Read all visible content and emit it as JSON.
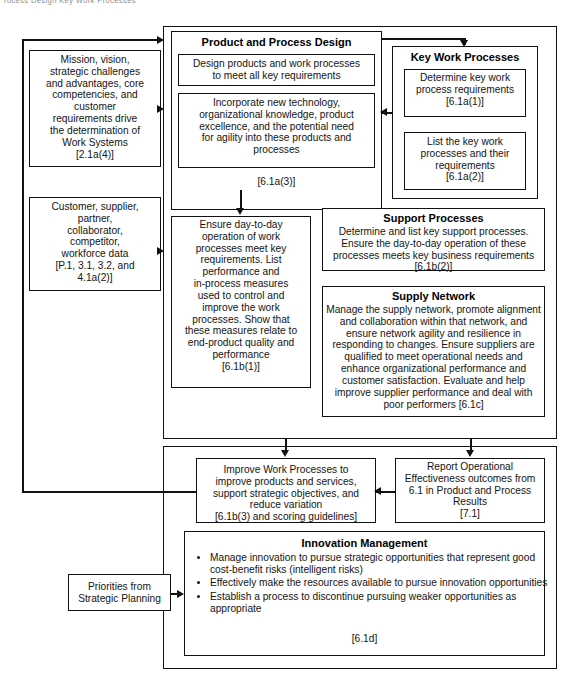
{
  "page": {
    "top_fragment": "rocess Design  Key Work Processes"
  },
  "left_column": {
    "box1": {
      "text": "Mission, vision,\nstrategic challenges\nand advantages, core\ncompetencies, and\ncustomer\nrequirements drive\nthe determination of\nWork Systems\n[2.1a(4)]"
    },
    "box2": {
      "text": "Customer, supplier,\npartner,\ncollaborator,\ncompetitor,\nworkforce data\n[P.1, 3.1, 3.2, and\n4.1a(2)]"
    },
    "box3": {
      "text": "Priorities from\nStrategic Planning"
    }
  },
  "product_process_design": {
    "title": "Product and Process Design",
    "sub1": "Design products and work processes\nto meet all key requirements",
    "sub2": "Incorporate new technology,\norganizational knowledge, product\nexcellence, and the potential need\nfor agility into these products and\nprocesses",
    "code": "[6.1a(3)]"
  },
  "key_work_processes": {
    "title": "Key Work Processes",
    "sub1": "Determine key work\nprocess requirements\n[6.1a(1)]",
    "sub2": "List the key work\nprocesses and their\nrequirements\n[6.1a(2)]"
  },
  "work_process_management": {
    "text": "Ensure day-to-day\noperation of work\nprocesses meet key\nrequirements. List\nperformance and\nin-process measures\nused to control and\nimprove the work\nprocesses. Show that\nthese measures relate to\nend-product quality and\nperformance\n[6.1b(1)]"
  },
  "support_processes": {
    "title": "Support Processes",
    "text": "Determine and list key support processes.\nEnsure the day-to-day operation of these\nprocesses meets key business requirements\n[6.1b(2)]"
  },
  "supply_network": {
    "title": "Supply Network",
    "text": "Manage the supply network, promote alignment\nand collaboration within that network, and\nensure  network agility and resilience in\nresponding to changes. Ensure suppliers are\nqualified to meet operational needs and\nenhance organizational performance and\ncustomer satisfaction. Evaluate and help\nimprove supplier performance and deal with\npoor performers  [6.1c]"
  },
  "improve_work_processes": {
    "text": "Improve Work Processes to\nimprove products and services,\nsupport strategic objectives, and\nreduce variation\n[6.1b(3) and scoring guidelines]"
  },
  "report_results": {
    "text": "Report Operational\nEffectiveness outcomes from\n6.1 in Product and Process\nResults\n[7.1]"
  },
  "innovation_management": {
    "title": "Innovation Management",
    "bullets": [
      "Manage innovation to pursue strategic opportunities that represent good cost-benefit risks (intelligent risks)",
      "Effectively make the resources available to pursue innovation opportunities",
      "Establish a process to discontinue pursuing weaker opportunities as appropriate"
    ],
    "code": "[6.1d]"
  }
}
